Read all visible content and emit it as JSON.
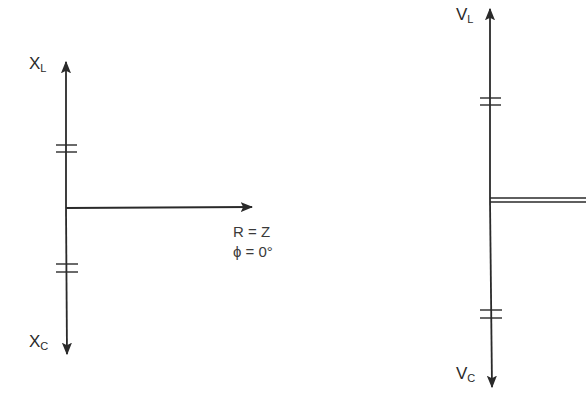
{
  "left_diagram": {
    "top_axis_label": {
      "main": "X",
      "sub": "L"
    },
    "bottom_axis_label": {
      "main": "X",
      "sub": "C"
    },
    "horizontal_label_line1": "R = Z",
    "horizontal_label_line2": "ϕ = 0°"
  },
  "right_diagram": {
    "top_axis_label": {
      "main": "V",
      "sub": "L"
    },
    "bottom_axis_label": {
      "main": "V",
      "sub": "C"
    }
  },
  "colors": {
    "line": "#2a2a2a",
    "background": "#ffffff"
  }
}
